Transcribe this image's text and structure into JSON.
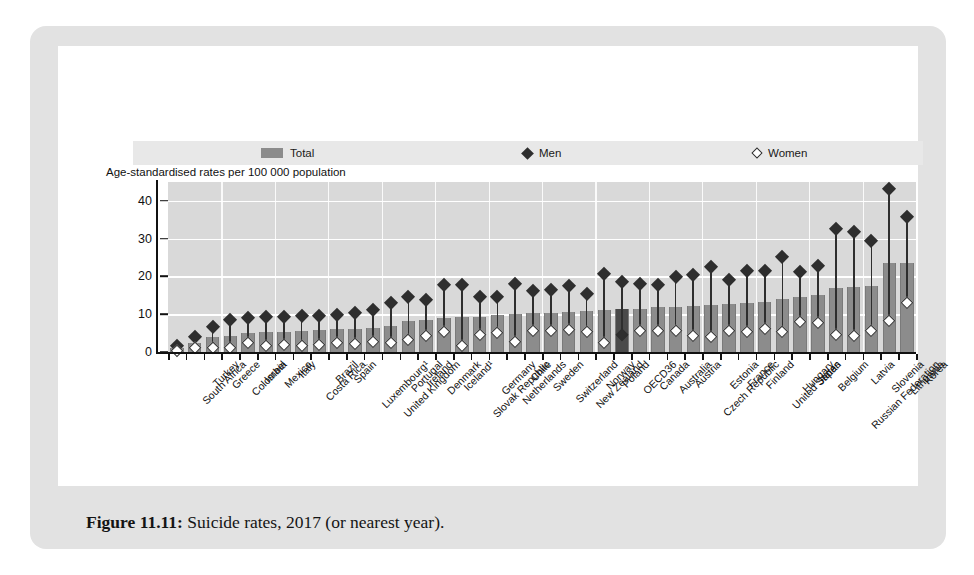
{
  "caption": {
    "figure_number": "Figure 11.11:",
    "text": " Suicide rates, 2017 (or nearest year)."
  },
  "axis_note": "Age-standardised rates per 100 000 population",
  "legend": [
    {
      "label": "Total",
      "marker": "bar-swatch"
    },
    {
      "label": "Men",
      "marker": "filled-diamond"
    },
    {
      "label": "Women",
      "marker": "open-diamond"
    }
  ],
  "colors": {
    "plot_background": "#d9d9d9",
    "gridline": "#ffffff",
    "bar": "#8c8c8c",
    "bar_highlight": "#4a4a4a",
    "marker": "#2e2e2e",
    "card": "#e2e2e2",
    "panel": "#ffffff"
  },
  "chart_data": {
    "type": "bar",
    "title": "Suicide rates, 2017 (or nearest year)",
    "subtitle": "Age-standardised rates per 100 000 population",
    "xlabel": "",
    "ylabel": "Age-standardised rates per 100 000 population",
    "ylim": [
      0,
      45
    ],
    "yticks": [
      0,
      10,
      20,
      30,
      40
    ],
    "grid": true,
    "legend_position": "top",
    "highlight_category": "OECD36",
    "categories": [
      "South Africa",
      "Turkey",
      "Greece",
      "Colombia",
      "Israel",
      "Mexico",
      "Italy",
      "Costa Rica",
      "Brazil",
      "Spain",
      "Luxembourg¹",
      "United Kingdom",
      "Portugal",
      "Ireland",
      "Denmark",
      "Iceland¹",
      "Slovak Republic",
      "Germany",
      "Netherlands",
      "Chile",
      "Sweden",
      "Switzerland",
      "New Zealand",
      "Norway",
      "Poland",
      "OECD36",
      "Canada",
      "Australia",
      "Austria",
      "Czech Republic",
      "Estonia",
      "France",
      "Finland",
      "United States",
      "Hungary",
      "Japan",
      "Belgium",
      "Russian Federation",
      "Latvia",
      "Slovenia",
      "Lithuania",
      "Korea"
    ],
    "series": [
      {
        "name": "Total",
        "marker": "bar",
        "values": [
          1.1,
          2.5,
          3.9,
          4.2,
          5.0,
          5.2,
          5.4,
          5.6,
          5.8,
          6.0,
          6.2,
          6.4,
          7.0,
          8.1,
          8.6,
          9.0,
          9.2,
          9.4,
          9.8,
          10.0,
          10.2,
          10.3,
          10.6,
          10.8,
          11.0,
          11.3,
          11.5,
          11.8,
          12.0,
          12.2,
          12.4,
          12.6,
          12.9,
          13.2,
          14.0,
          14.6,
          15.0,
          17.0,
          17.3,
          17.6,
          23.5,
          23.6
        ]
      },
      {
        "name": "Men",
        "marker": "filled-diamond",
        "values": [
          1.8,
          4.2,
          6.8,
          8.6,
          9.2,
          9.3,
          9.3,
          9.6,
          9.7,
          10.0,
          10.5,
          11.2,
          13.2,
          14.6,
          14.0,
          17.8,
          17.8,
          14.6,
          14.8,
          18.2,
          16.4,
          16.6,
          17.5,
          15.6,
          20.8,
          18.6,
          18.2,
          18.0,
          20.0,
          20.4,
          22.6,
          19.2,
          21.6,
          21.6,
          25.4,
          21.4,
          22.8,
          32.8,
          31.8,
          29.4,
          43.2,
          36.0
        ]
      },
      {
        "name": "Women",
        "marker": "open-diamond",
        "values": [
          0.5,
          1.1,
          1.3,
          1.2,
          2.6,
          1.6,
          1.9,
          1.8,
          2.0,
          2.4,
          2.3,
          2.8,
          2.6,
          3.4,
          4.5,
          5.4,
          1.8,
          4.7,
          5.2,
          2.8,
          5.8,
          5.6,
          6.0,
          5.3,
          2.4,
          4.6,
          5.8,
          5.6,
          5.6,
          4.5,
          4.0,
          5.6,
          5.4,
          6.2,
          5.4,
          8.2,
          7.8,
          4.6,
          4.4,
          5.6,
          8.3,
          13.0
        ]
      }
    ]
  }
}
